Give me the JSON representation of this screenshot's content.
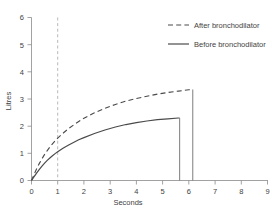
{
  "chart_data": {
    "type": "line",
    "title": "",
    "xlabel": "Seconds",
    "ylabel": "Litres",
    "xlim": [
      0,
      9
    ],
    "ylim": [
      0,
      6
    ],
    "xticks": [
      "0",
      "1",
      "2",
      "3",
      "4",
      "5",
      "6",
      "7",
      "8",
      "9"
    ],
    "yticks": [
      "0",
      "1",
      "2",
      "3",
      "4",
      "5",
      "6"
    ],
    "grid": false,
    "legend_position": "top-right",
    "annotations": [
      {
        "name": "one-second-marker",
        "type": "vertical-dashed-line",
        "x": 1,
        "color": "#b0b0b0"
      }
    ],
    "series": [
      {
        "name": "After bronchodilator",
        "style": "dashed",
        "color": "#4a4a4a",
        "plateau": 3.35,
        "end_x": 6.15,
        "fev1": 1.55,
        "x": [
          0,
          0.1,
          0.2,
          0.3,
          0.4,
          0.5,
          0.6,
          0.7,
          0.8,
          0.9,
          1.0,
          1.2,
          1.4,
          1.6,
          1.8,
          2.0,
          2.4,
          2.8,
          3.2,
          3.6,
          4.0,
          4.4,
          4.8,
          5.2,
          5.6,
          6.0,
          6.15
        ],
        "y": [
          0,
          0.23,
          0.44,
          0.63,
          0.8,
          0.96,
          1.1,
          1.23,
          1.35,
          1.46,
          1.56,
          1.74,
          1.9,
          2.04,
          2.17,
          2.29,
          2.49,
          2.66,
          2.8,
          2.92,
          3.02,
          3.1,
          3.18,
          3.24,
          3.29,
          3.34,
          3.35
        ]
      },
      {
        "name": "Before bronchodilator",
        "style": "solid",
        "color": "#4a4a4a",
        "plateau": 2.3,
        "end_x": 5.65,
        "fev1": 1.05,
        "x": [
          0,
          0.1,
          0.2,
          0.3,
          0.4,
          0.5,
          0.6,
          0.7,
          0.8,
          0.9,
          1.0,
          1.2,
          1.4,
          1.6,
          1.8,
          2.0,
          2.4,
          2.8,
          3.2,
          3.6,
          4.0,
          4.4,
          4.8,
          5.2,
          5.6,
          5.65
        ],
        "y": [
          0,
          0.14,
          0.28,
          0.41,
          0.53,
          0.64,
          0.74,
          0.83,
          0.91,
          0.99,
          1.06,
          1.19,
          1.3,
          1.4,
          1.5,
          1.58,
          1.73,
          1.86,
          1.97,
          2.06,
          2.13,
          2.19,
          2.24,
          2.27,
          2.3,
          2.3
        ]
      }
    ]
  },
  "legend": {
    "items": [
      {
        "label": "After bronchodilator",
        "style": "dashed"
      },
      {
        "label": "Before bronchodilator",
        "style": "solid"
      }
    ]
  }
}
